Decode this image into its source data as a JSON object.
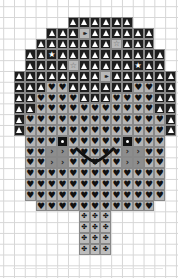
{
  "chart": {
    "grid": {
      "cell_px": 10.8,
      "origin_x": 14,
      "origin_y": 17,
      "cols": 15
    },
    "symbols": {
      "tri": "▲",
      "ff": "▸▸",
      "star": "★",
      "gstar": "☆",
      "heart": "♥",
      "eye": "●",
      "cheek": "›",
      "trunk": "✤"
    },
    "colors": {
      "dark": "#1e1e1e",
      "gray": "#b5b5b5",
      "cheek": "#8d8d8d",
      "trunk": "#bdbdbd"
    },
    "rows": [
      {
        "r": 0,
        "cells": [
          [
            5,
            "tri"
          ],
          [
            6,
            "tri"
          ],
          [
            7,
            "tri"
          ],
          [
            8,
            "tri"
          ],
          [
            9,
            "tri"
          ],
          [
            10,
            "tri"
          ]
        ]
      },
      {
        "r": 1,
        "cells": [
          [
            3,
            "tri"
          ],
          [
            4,
            "tri"
          ],
          [
            5,
            "tri"
          ],
          [
            6,
            "ff"
          ],
          [
            7,
            "tri"
          ],
          [
            8,
            "tri"
          ],
          [
            9,
            "tri"
          ],
          [
            10,
            "tri"
          ],
          [
            11,
            "tri"
          ],
          [
            12,
            "tri"
          ]
        ]
      },
      {
        "r": 2,
        "cells": [
          [
            2,
            "tri"
          ],
          [
            3,
            "tri"
          ],
          [
            4,
            "tri"
          ],
          [
            5,
            "tri"
          ],
          [
            6,
            "tri"
          ],
          [
            7,
            "tri"
          ],
          [
            8,
            "tri"
          ],
          [
            9,
            "gstar"
          ],
          [
            10,
            "tri"
          ],
          [
            11,
            "tri"
          ],
          [
            12,
            "tri"
          ]
        ]
      },
      {
        "r": 3,
        "cells": [
          [
            1,
            "tri"
          ],
          [
            2,
            "tri"
          ],
          [
            3,
            "star"
          ],
          [
            4,
            "tri"
          ],
          [
            5,
            "tri"
          ],
          [
            6,
            "tri"
          ],
          [
            7,
            "tri"
          ],
          [
            8,
            "tri"
          ],
          [
            9,
            "tri"
          ],
          [
            10,
            "tri"
          ],
          [
            11,
            "tri"
          ],
          [
            12,
            "tri"
          ],
          [
            13,
            "tri"
          ]
        ]
      },
      {
        "r": 4,
        "cells": [
          [
            1,
            "tri"
          ],
          [
            2,
            "tri"
          ],
          [
            3,
            "tri"
          ],
          [
            4,
            "tri"
          ],
          [
            5,
            "gstar"
          ],
          [
            6,
            "tri"
          ],
          [
            7,
            "tri"
          ],
          [
            8,
            "tri"
          ],
          [
            9,
            "tri"
          ],
          [
            10,
            "tri"
          ],
          [
            11,
            "star"
          ],
          [
            12,
            "tri"
          ],
          [
            13,
            "tri"
          ]
        ]
      },
      {
        "r": 5,
        "cells": [
          [
            0,
            "tri"
          ],
          [
            1,
            "tri"
          ],
          [
            2,
            "tri"
          ],
          [
            3,
            "tri"
          ],
          [
            4,
            "tri"
          ],
          [
            5,
            "tri"
          ],
          [
            6,
            "tri"
          ],
          [
            7,
            "tri"
          ],
          [
            8,
            "ff"
          ],
          [
            9,
            "tri"
          ],
          [
            10,
            "tri"
          ],
          [
            11,
            "tri"
          ],
          [
            12,
            "tri"
          ],
          [
            13,
            "tri"
          ],
          [
            14,
            "tri"
          ]
        ]
      },
      {
        "r": 6,
        "cells": [
          [
            0,
            "tri"
          ],
          [
            1,
            "tri"
          ],
          [
            2,
            "tri"
          ],
          [
            3,
            "heart"
          ],
          [
            4,
            "heart"
          ],
          [
            5,
            "tri"
          ],
          [
            6,
            "tri"
          ],
          [
            7,
            "tri"
          ],
          [
            8,
            "tri"
          ],
          [
            9,
            "tri"
          ],
          [
            10,
            "tri"
          ],
          [
            11,
            "heart"
          ],
          [
            12,
            "heart"
          ],
          [
            13,
            "tri"
          ],
          [
            14,
            "tri"
          ]
        ]
      },
      {
        "r": 7,
        "cells": [
          [
            0,
            "tri"
          ],
          [
            1,
            "tri"
          ],
          [
            2,
            "heart"
          ],
          [
            3,
            "heart"
          ],
          [
            4,
            "heart"
          ],
          [
            5,
            "heart"
          ],
          [
            6,
            "tri"
          ],
          [
            7,
            "tri"
          ],
          [
            8,
            "tri"
          ],
          [
            9,
            "heart"
          ],
          [
            10,
            "heart"
          ],
          [
            11,
            "heart"
          ],
          [
            12,
            "heart"
          ],
          [
            13,
            "tri"
          ],
          [
            14,
            "tri"
          ]
        ]
      },
      {
        "r": 8,
        "cells": [
          [
            0,
            "tri"
          ],
          [
            1,
            "tri"
          ],
          [
            2,
            "heart"
          ],
          [
            3,
            "heart"
          ],
          [
            4,
            "heart"
          ],
          [
            5,
            "heart"
          ],
          [
            6,
            "heart"
          ],
          [
            7,
            "heart"
          ],
          [
            8,
            "heart"
          ],
          [
            9,
            "heart"
          ],
          [
            10,
            "heart"
          ],
          [
            11,
            "heart"
          ],
          [
            12,
            "heart"
          ],
          [
            13,
            "tri"
          ],
          [
            14,
            "tri"
          ]
        ]
      },
      {
        "r": 9,
        "cells": [
          [
            0,
            "tri"
          ],
          [
            1,
            "heart"
          ],
          [
            2,
            "heart"
          ],
          [
            3,
            "heart"
          ],
          [
            4,
            "heart"
          ],
          [
            5,
            "heart"
          ],
          [
            6,
            "heart"
          ],
          [
            7,
            "heart"
          ],
          [
            8,
            "heart"
          ],
          [
            9,
            "heart"
          ],
          [
            10,
            "heart"
          ],
          [
            11,
            "heart"
          ],
          [
            12,
            "heart"
          ],
          [
            13,
            "heart"
          ],
          [
            14,
            "tri"
          ]
        ]
      },
      {
        "r": 10,
        "cells": [
          [
            0,
            "tri"
          ],
          [
            1,
            "heart"
          ],
          [
            2,
            "heart"
          ],
          [
            3,
            "heart"
          ],
          [
            4,
            "heart"
          ],
          [
            5,
            "heart"
          ],
          [
            6,
            "heart"
          ],
          [
            7,
            "heart"
          ],
          [
            8,
            "heart"
          ],
          [
            9,
            "heart"
          ],
          [
            10,
            "heart"
          ],
          [
            11,
            "heart"
          ],
          [
            12,
            "heart"
          ],
          [
            13,
            "heart"
          ],
          [
            14,
            "tri"
          ]
        ]
      },
      {
        "r": 11,
        "cells": [
          [
            1,
            "heart"
          ],
          [
            2,
            "heart"
          ],
          [
            3,
            "heart"
          ],
          [
            4,
            "eye"
          ],
          [
            5,
            "heart"
          ],
          [
            6,
            "heart"
          ],
          [
            7,
            "heart"
          ],
          [
            8,
            "heart"
          ],
          [
            9,
            "heart"
          ],
          [
            10,
            "eye"
          ],
          [
            11,
            "heart"
          ],
          [
            12,
            "heart"
          ],
          [
            13,
            "heart"
          ]
        ]
      },
      {
        "r": 12,
        "cells": [
          [
            1,
            "heart"
          ],
          [
            2,
            "heart"
          ],
          [
            3,
            "cheek"
          ],
          [
            4,
            "cheek"
          ],
          [
            5,
            "heart"
          ],
          [
            6,
            "heart"
          ],
          [
            7,
            "heart"
          ],
          [
            8,
            "heart"
          ],
          [
            9,
            "heart"
          ],
          [
            10,
            "cheek"
          ],
          [
            11,
            "cheek"
          ],
          [
            12,
            "heart"
          ],
          [
            13,
            "heart"
          ]
        ]
      },
      {
        "r": 13,
        "cells": [
          [
            1,
            "heart"
          ],
          [
            2,
            "heart"
          ],
          [
            3,
            "cheek"
          ],
          [
            4,
            "cheek"
          ],
          [
            5,
            "heart"
          ],
          [
            6,
            "heart"
          ],
          [
            7,
            "heart"
          ],
          [
            8,
            "heart"
          ],
          [
            9,
            "heart"
          ],
          [
            10,
            "cheek"
          ],
          [
            11,
            "cheek"
          ],
          [
            12,
            "heart"
          ],
          [
            13,
            "heart"
          ]
        ]
      },
      {
        "r": 14,
        "cells": [
          [
            1,
            "heart"
          ],
          [
            2,
            "heart"
          ],
          [
            3,
            "heart"
          ],
          [
            4,
            "heart"
          ],
          [
            5,
            "heart"
          ],
          [
            6,
            "heart"
          ],
          [
            7,
            "heart"
          ],
          [
            8,
            "heart"
          ],
          [
            9,
            "heart"
          ],
          [
            10,
            "heart"
          ],
          [
            11,
            "heart"
          ],
          [
            12,
            "heart"
          ],
          [
            13,
            "heart"
          ]
        ]
      },
      {
        "r": 15,
        "cells": [
          [
            1,
            "heart"
          ],
          [
            2,
            "heart"
          ],
          [
            3,
            "heart"
          ],
          [
            4,
            "heart"
          ],
          [
            5,
            "heart"
          ],
          [
            6,
            "heart"
          ],
          [
            7,
            "heart"
          ],
          [
            8,
            "heart"
          ],
          [
            9,
            "heart"
          ],
          [
            10,
            "heart"
          ],
          [
            11,
            "heart"
          ],
          [
            12,
            "heart"
          ],
          [
            13,
            "heart"
          ]
        ]
      },
      {
        "r": 16,
        "cells": [
          [
            1,
            "heart"
          ],
          [
            2,
            "heart"
          ],
          [
            3,
            "heart"
          ],
          [
            4,
            "heart"
          ],
          [
            5,
            "heart"
          ],
          [
            6,
            "heart"
          ],
          [
            7,
            "heart"
          ],
          [
            8,
            "heart"
          ],
          [
            9,
            "heart"
          ],
          [
            10,
            "heart"
          ],
          [
            11,
            "heart"
          ],
          [
            12,
            "heart"
          ],
          [
            13,
            "heart"
          ]
        ]
      },
      {
        "r": 17,
        "cells": [
          [
            2,
            "heart"
          ],
          [
            3,
            "heart"
          ],
          [
            4,
            "heart"
          ],
          [
            5,
            "heart"
          ],
          [
            6,
            "heart"
          ],
          [
            7,
            "heart"
          ],
          [
            8,
            "heart"
          ],
          [
            9,
            "heart"
          ],
          [
            10,
            "heart"
          ],
          [
            11,
            "heart"
          ],
          [
            12,
            "heart"
          ]
        ]
      },
      {
        "r": 18,
        "cells": [
          [
            6,
            "trunk"
          ],
          [
            7,
            "trunk"
          ],
          [
            8,
            "trunk"
          ]
        ]
      },
      {
        "r": 19,
        "cells": [
          [
            6,
            "trunk"
          ],
          [
            7,
            "trunk"
          ],
          [
            8,
            "trunk"
          ]
        ]
      },
      {
        "r": 20,
        "cells": [
          [
            6,
            "trunk"
          ],
          [
            7,
            "trunk"
          ],
          [
            8,
            "trunk"
          ]
        ]
      },
      {
        "r": 21,
        "cells": [
          [
            6,
            "trunk"
          ],
          [
            7,
            "trunk"
          ],
          [
            8,
            "trunk"
          ]
        ]
      }
    ],
    "mouth": {
      "shape": "smile-curve",
      "from_col": 5.8,
      "to_col": 9.2,
      "row": 12.2
    }
  }
}
